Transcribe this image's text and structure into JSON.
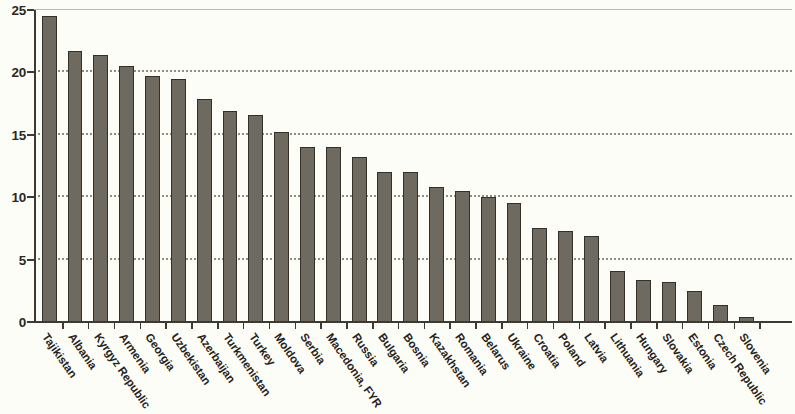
{
  "chart_data": {
    "type": "bar",
    "title": "",
    "subtitle": "",
    "xlabel": "",
    "ylabel": "",
    "ylim": [
      0,
      25
    ],
    "yticks": [
      0,
      5,
      10,
      15,
      20,
      25
    ],
    "ytick_labels": [
      "0",
      "5",
      "10",
      "15",
      "20",
      "25"
    ],
    "grid": true,
    "grid_axis": "y",
    "legend": false,
    "legend_position": "none",
    "orientation": "vertical",
    "bar_color": "#6e6a60",
    "bar_edge_color": "#332f29",
    "background_color": "#fdfdf7",
    "axis_color": "#3d3a34",
    "grid_color": "#7a7a70",
    "categories": [
      "Tajikistan",
      "Albania",
      "Kyrgyz Republic",
      "Armenia",
      "Georgia",
      "Uzbekistan",
      "Azerbaijan",
      "Turkmenistan",
      "Turkey",
      "Moldova",
      "Serbia",
      "Macedonia, FYR",
      "Russia",
      "Bulgaria",
      "Bosnia",
      "Kazakhstan",
      "Romania",
      "Belarus",
      "Ukraine",
      "Croatia",
      "Poland",
      "Latvia",
      "Lithuania",
      "Hungary",
      "Slovakia",
      "Estonia",
      "Czech Republic",
      "Slovenia"
    ],
    "values": [
      24.5,
      21.7,
      21.4,
      20.5,
      19.7,
      19.5,
      17.9,
      16.9,
      16.6,
      15.2,
      14.0,
      14.0,
      13.2,
      12.0,
      12.0,
      10.8,
      10.5,
      10.0,
      9.5,
      7.5,
      7.3,
      6.9,
      4.1,
      3.4,
      3.2,
      2.5,
      1.4,
      0.4
    ]
  }
}
